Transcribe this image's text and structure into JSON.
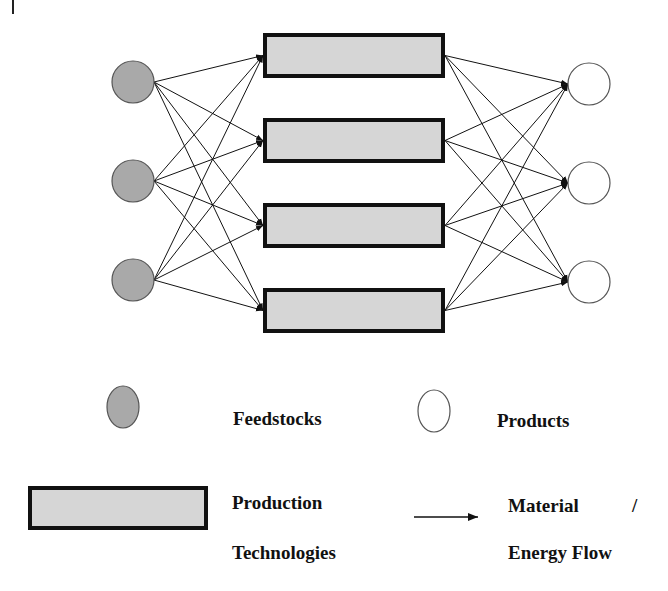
{
  "diagram": {
    "colors": {
      "feedstock_fill": "#a9a9a9",
      "product_fill": "#ffffff",
      "technology_fill": "#d6d6d6",
      "stroke": "#111111",
      "circle_stroke": "#555555"
    },
    "feedstocks": [
      {
        "id": "F1",
        "cx": 133,
        "cy": 82
      },
      {
        "id": "F2",
        "cx": 133,
        "cy": 181
      },
      {
        "id": "F3",
        "cx": 133,
        "cy": 280
      }
    ],
    "technologies": [
      {
        "id": "T1",
        "x": 263,
        "y": 33,
        "w": 182,
        "h": 45
      },
      {
        "id": "T2",
        "x": 263,
        "y": 118,
        "w": 182,
        "h": 45
      },
      {
        "id": "T3",
        "x": 263,
        "y": 203,
        "w": 182,
        "h": 45
      },
      {
        "id": "T4",
        "x": 263,
        "y": 288,
        "w": 182,
        "h": 45
      }
    ],
    "products": [
      {
        "id": "P1",
        "cx": 589,
        "cy": 84
      },
      {
        "id": "P2",
        "cx": 589,
        "cy": 183
      },
      {
        "id": "P3",
        "cx": 589,
        "cy": 282
      }
    ],
    "node_radius": 21,
    "connectivity": "fully connected: every feedstock to every technology, every technology to every product"
  },
  "legend": {
    "feedstocks_label": "Feedstocks",
    "products_label": "Products",
    "technologies_label_line1": "Production",
    "technologies_label_line2": "Technologies",
    "flow_label_line1": "Material",
    "flow_label_slash": "/",
    "flow_label_line2": "Energy Flow"
  }
}
